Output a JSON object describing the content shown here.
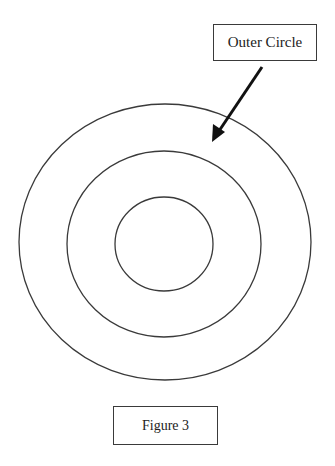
{
  "diagram": {
    "type": "concentric-circles",
    "circles": [
      {
        "name": "outer",
        "cx": 165,
        "cy": 242,
        "rx": 146,
        "ry": 138
      },
      {
        "name": "middle",
        "cx": 164,
        "cy": 244,
        "rx": 97,
        "ry": 93
      },
      {
        "name": "inner",
        "cx": 164,
        "cy": 244,
        "rx": 49,
        "ry": 47
      }
    ],
    "arrow": {
      "from": [
        262,
        67
      ],
      "to": [
        213,
        140
      ],
      "points_to": "Outer Circle"
    },
    "stroke_color": "#3a3a3a",
    "arrow_color": "#111111"
  },
  "labels": {
    "outer_circle": "Outer Circle",
    "caption": "Figure 3"
  }
}
